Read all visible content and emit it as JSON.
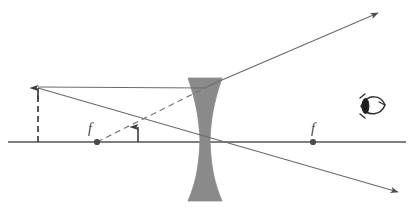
{
  "diagram": {
    "type": "ray-optics",
    "background_color": "#ffffff",
    "line_color": "#555555",
    "lens_color": "#8a8a8a",
    "label_color": "#3a3a3a",
    "optical_axis": {
      "name": "optical-axis",
      "x1": 8,
      "y1": 142,
      "x2": 406,
      "y2": 142
    },
    "lens": {
      "name": "diverging-lens",
      "kind": "biconcave",
      "center_x": 205,
      "top_y": 78,
      "bottom_y": 201,
      "edge_half_width": 17,
      "waist_half_width": 5
    },
    "object": {
      "name": "object-arrow",
      "x": 38,
      "base_y": 142,
      "tip_y": 87,
      "style": "dashed",
      "label": ""
    },
    "image": {
      "name": "image-arrow",
      "x": 138,
      "base_y": 142,
      "tip_y": 124,
      "style": "solid",
      "label": ""
    },
    "focal_points": [
      {
        "name": "focal-point-left",
        "label": "f",
        "x": 97,
        "y": 142,
        "label_x": 90,
        "label_y": 131
      },
      {
        "name": "focal-point-right",
        "label": "f",
        "x": 313,
        "y": 142,
        "label_x": 306,
        "label_y": 131
      }
    ],
    "rays": [
      {
        "name": "ray-parallel-incident",
        "style": "solid",
        "arrow": false,
        "points": "38,87 205,87"
      },
      {
        "name": "ray-parallel-refracted",
        "style": "solid",
        "arrow": true,
        "points": "205,85 380,12"
      },
      {
        "name": "ray-through-center",
        "style": "solid",
        "arrow": true,
        "points": "38,88 400,193"
      },
      {
        "name": "ray-virtual-extension",
        "style": "dashed",
        "arrow": false,
        "points": "97,142 218,82"
      }
    ],
    "eye": {
      "name": "observer-eye",
      "x": 372,
      "y": 106,
      "facing": "left"
    }
  }
}
